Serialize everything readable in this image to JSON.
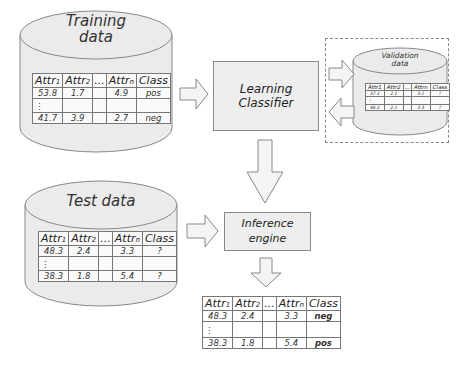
{
  "training": {
    "title_line1": "Training",
    "title_line2": "data",
    "headers": [
      "Attr1",
      "Attr2",
      "...",
      "Attrn",
      "Class"
    ],
    "rows": [
      [
        "53.8",
        "1.7",
        "",
        "4.9",
        "pos"
      ],
      [
        "⋮",
        "",
        "",
        "",
        ""
      ],
      [
        "41.7",
        "3.9",
        "",
        "2.7",
        "neg"
      ]
    ]
  },
  "learning_classifier": {
    "label": "Learning Classifier"
  },
  "validation": {
    "title_line1": "Validation",
    "title_line2": "data",
    "headers": [
      "Attr1",
      "Attr2",
      "...",
      "Attrn",
      "Class"
    ],
    "rows": [
      [
        "37.1",
        "2.1",
        "",
        "3.1",
        "?"
      ],
      [
        "⋮",
        "",
        "",
        "",
        ""
      ],
      [
        "46.2",
        "2.1",
        "",
        "3.3",
        "?"
      ]
    ]
  },
  "test": {
    "title": "Test data",
    "headers": [
      "Attr1",
      "Attr2",
      "...",
      "Attrn",
      "Class"
    ],
    "rows": [
      [
        "48.3",
        "2.4",
        "",
        "3.3",
        "?"
      ],
      [
        "⋮",
        "",
        "",
        "",
        ""
      ],
      [
        "38.3",
        "1.8",
        "",
        "5.4",
        "?"
      ]
    ]
  },
  "inference_engine": {
    "label_line1": "Inference",
    "label_line2": "engine"
  },
  "output": {
    "headers": [
      "Attr1",
      "Attr2",
      "...",
      "Attrn",
      "Class"
    ],
    "rows": [
      [
        "48.3",
        "2.4",
        "",
        "3.3",
        "neg"
      ],
      [
        "⋮",
        "",
        "",
        "",
        ""
      ],
      [
        "38.3",
        "1.8",
        "",
        "5.4",
        "pos"
      ]
    ]
  },
  "colors": {
    "fill": "#eeeeee",
    "stroke": "#888888",
    "arrow_fill": "#f4f4f4",
    "text": "#222222"
  }
}
